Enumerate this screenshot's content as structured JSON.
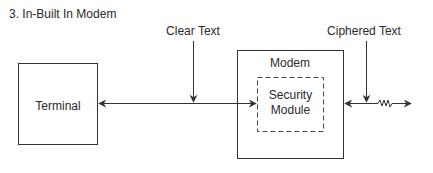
{
  "title": "3. In-Built In Modem",
  "labels": {
    "clear_text": "Clear Text",
    "ciphered_text": "Ciphered Text"
  },
  "nodes": {
    "terminal": "Terminal",
    "modem": "Modem",
    "security_module_line1": "Security",
    "security_module_line2": "Module"
  },
  "colors": {
    "stroke": "#333333",
    "text": "#2a2a2a",
    "background": "#ffffff"
  }
}
